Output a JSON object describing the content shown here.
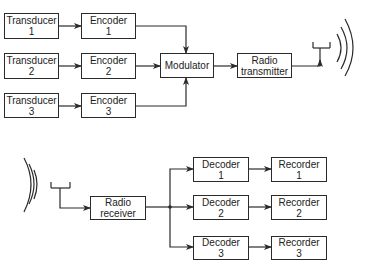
{
  "transmitter_section": {
    "transducers": [
      {
        "label": "Transducer",
        "num": "1"
      },
      {
        "label": "Transducer",
        "num": "2"
      },
      {
        "label": "Transducer",
        "num": "3"
      }
    ],
    "encoders": [
      {
        "label": "Encoder",
        "num": "1"
      },
      {
        "label": "Encoder",
        "num": "2"
      },
      {
        "label": "Encoder",
        "num": "3"
      }
    ],
    "modulator": {
      "label": "Modulator"
    },
    "radio_transmitter": {
      "line1": "Radio",
      "line2": "transmitter"
    },
    "antenna": "antenna-icon",
    "waves": "radio-waves-icon"
  },
  "receiver_section": {
    "antenna": "antenna-icon",
    "waves": "radio-waves-icon",
    "radio_receiver": {
      "line1": "Radio",
      "line2": "receiver"
    },
    "decoders": [
      {
        "label": "Decoder",
        "num": "1"
      },
      {
        "label": "Decoder",
        "num": "2"
      },
      {
        "label": "Decoder",
        "num": "3"
      }
    ],
    "recorders": [
      {
        "label": "Recorder",
        "num": "1"
      },
      {
        "label": "Recorder",
        "num": "2"
      },
      {
        "label": "Recorder",
        "num": "3"
      }
    ]
  }
}
